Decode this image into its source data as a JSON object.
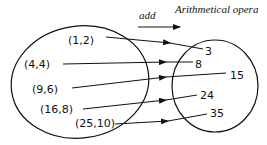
{
  "diagram": {
    "title": "Arithmetical opera",
    "operation_label": "add",
    "domain_set": {
      "name": "input-pairs",
      "elements": [
        "(1,2)",
        "(4,4)",
        "(9,6)",
        "(16,8)",
        "(25,10)"
      ]
    },
    "codomain_set": {
      "name": "results",
      "elements": [
        "3",
        "8",
        "15",
        "24",
        "35"
      ]
    },
    "mappings": [
      {
        "from": "(1,2)",
        "to": "3"
      },
      {
        "from": "(4,4)",
        "to": "8"
      },
      {
        "from": "(9,6)",
        "to": "15"
      },
      {
        "from": "(16,8)",
        "to": "24"
      },
      {
        "from": "(25,10)",
        "to": "35"
      }
    ],
    "colors": {
      "ink": "#111111",
      "background": "#ffffff"
    }
  }
}
